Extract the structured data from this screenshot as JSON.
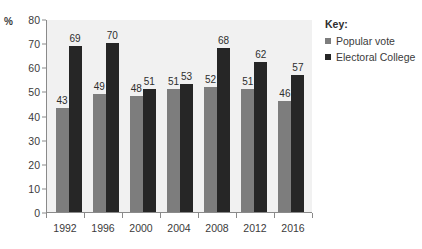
{
  "chart_data": {
    "type": "bar",
    "title": "",
    "xlabel": "",
    "ylabel": "%",
    "ylim": [
      0,
      80
    ],
    "ytick_step": 10,
    "yticks": [
      80,
      70,
      60,
      50,
      40,
      30,
      20,
      10,
      0
    ],
    "grid": false,
    "legend_position": "right",
    "categories": [
      "1992",
      "1996",
      "2000",
      "2004",
      "2008",
      "2012",
      "2016"
    ],
    "series": [
      {
        "name": "Popular vote",
        "color": "#7d7d7d",
        "values": [
          43,
          49,
          48,
          51,
          52,
          51,
          46
        ]
      },
      {
        "name": "Electoral College",
        "color": "#262626",
        "values": [
          69,
          70,
          51,
          53,
          68,
          62,
          57
        ]
      }
    ]
  },
  "legend": {
    "title": "Key:"
  },
  "colors": {
    "popular_vote": "#7d7d7d",
    "electoral_college": "#262626",
    "plot_background": "#f1f1f1",
    "axis": "#8a8a8a",
    "text": "#3b3b3b"
  }
}
